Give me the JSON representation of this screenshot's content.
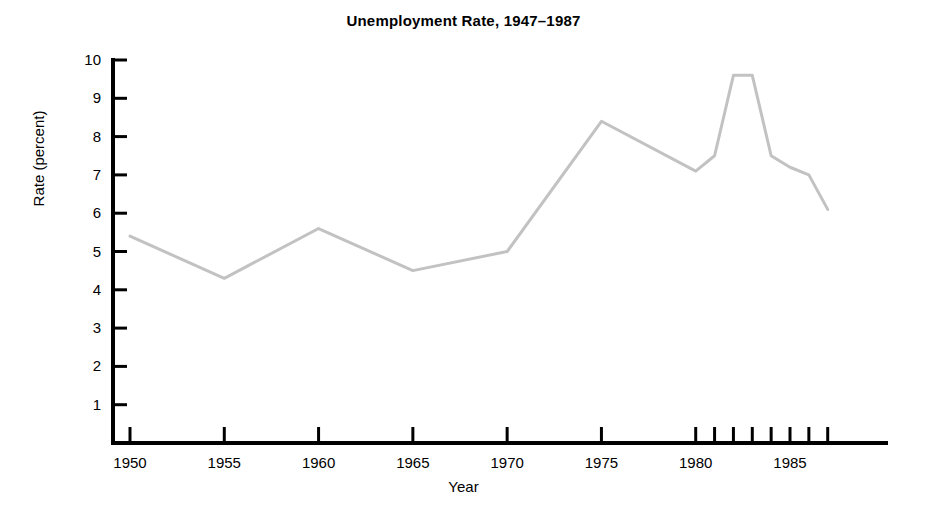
{
  "chart_data": {
    "type": "line",
    "title": "Unemployment Rate, 1947–1987",
    "xlabel": "Year",
    "ylabel": "Rate (percent)",
    "xlim": [
      1949,
      1987.5
    ],
    "ylim": [
      0,
      10
    ],
    "grid": false,
    "legend": null,
    "line_color": "#c2c2c2",
    "line_width": 3,
    "axis_color": "#000000",
    "x": [
      1950,
      1955,
      1960,
      1965,
      1970,
      1975,
      1980,
      1981,
      1982,
      1983,
      1984,
      1985,
      1986,
      1987
    ],
    "values": [
      5.4,
      4.3,
      5.6,
      4.5,
      5.0,
      8.4,
      7.1,
      7.5,
      9.6,
      9.6,
      7.5,
      7.2,
      7.0,
      6.1
    ],
    "series": [
      {
        "name": "Unemployment Rate",
        "values": [
          5.4,
          4.3,
          5.6,
          4.5,
          5.0,
          8.4,
          7.1,
          7.5,
          9.6,
          9.6,
          7.5,
          7.2,
          7.0,
          6.1
        ]
      }
    ],
    "yticks": [
      1,
      2,
      3,
      4,
      5,
      6,
      7,
      8,
      9,
      10
    ],
    "ytick_labels": [
      "1",
      "2",
      "3",
      "4",
      "5",
      "6",
      "7",
      "8",
      "9",
      "10"
    ],
    "xticks": [
      1950,
      1955,
      1960,
      1965,
      1970,
      1975,
      1980,
      1981,
      1982,
      1983,
      1984,
      1985,
      1986,
      1987
    ],
    "xtick_labels_shown": [
      "1950",
      "1955",
      "1960",
      "1965",
      "1970",
      "1975",
      "1980",
      "1985"
    ],
    "xtick_labeled_values": [
      1950,
      1955,
      1960,
      1965,
      1970,
      1975,
      1980,
      1985
    ]
  },
  "figure": {
    "background": "#ffffff",
    "title": "Unemployment Rate, 1947–1987",
    "xlabel": "Year",
    "ylabel": "Rate (percent)"
  }
}
